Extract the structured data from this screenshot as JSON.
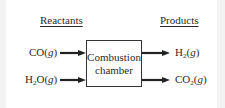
{
  "diagram": {
    "reactants_header": "Reactants",
    "products_header": "Products",
    "chamber": {
      "line1": "Combustion",
      "line2": "chamber"
    },
    "reactants": [
      {
        "base": "CO(",
        "sub": "",
        "rest": "",
        "phase": "g",
        "close": ")"
      },
      {
        "base": "H",
        "sub": "2",
        "rest": "O(",
        "phase": "g",
        "close": ")"
      }
    ],
    "products": [
      {
        "base": "H",
        "sub": "2",
        "rest": "(",
        "phase": "g",
        "close": ")"
      },
      {
        "base": "CO",
        "sub": "2",
        "rest": "(",
        "phase": "g",
        "close": ")"
      }
    ]
  }
}
